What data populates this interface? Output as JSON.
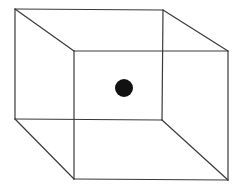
{
  "diagram": {
    "type": "wireframe-cube",
    "stroke_color": "#3a3a3a",
    "background": "#ffffff",
    "back_face": {
      "top_left": [
        15,
        9
      ],
      "top_right": [
        163,
        10
      ],
      "bottom_right": [
        162,
        120
      ],
      "bottom_left": [
        15,
        119
      ]
    },
    "front_face": {
      "top_left": [
        74,
        51
      ],
      "top_right": [
        228,
        51
      ],
      "bottom_right": [
        228,
        180
      ],
      "bottom_left": [
        74,
        179
      ]
    },
    "dot": {
      "center": [
        124,
        88
      ],
      "radius": 9,
      "color": "#111111"
    }
  }
}
